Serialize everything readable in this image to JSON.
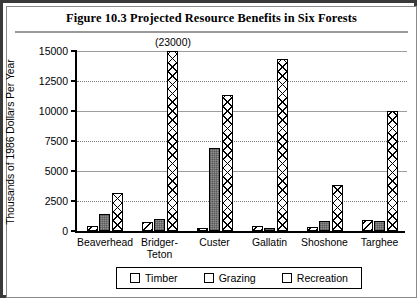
{
  "figure": {
    "title": "Figure 10.3   Projected Resource Benefits in Six Forests"
  },
  "chart_data": {
    "type": "bar",
    "title": "Figure 10.3   Projected Resource Benefits in Six Forests",
    "xlabel": "",
    "ylabel": "Thousands of 1986 Dollars Per Year",
    "ylim": [
      0,
      15000
    ],
    "yticks": [
      "0",
      "2500",
      "5000",
      "7500",
      "10000",
      "12500",
      "15000"
    ],
    "ytick_values": [
      0,
      2500,
      5000,
      7500,
      10000,
      12500,
      15000
    ],
    "grid": true,
    "legend_position": "bottom",
    "categories": [
      "Beaverhead",
      "Bridger-\nTeton",
      "Custer",
      "Gallatin",
      "Shoshone",
      "Targhee"
    ],
    "series": [
      {
        "name": "Timber",
        "pattern": "diagonal-hatch",
        "values": [
          400,
          750,
          200,
          450,
          300,
          900
        ]
      },
      {
        "name": "Grazing",
        "pattern": "solid-gray",
        "values": [
          1400,
          1000,
          6900,
          200,
          850,
          800
        ]
      },
      {
        "name": "Recreation",
        "pattern": "cross-hatch",
        "values": [
          3200,
          23000,
          11300,
          14300,
          3800,
          10000
        ]
      }
    ],
    "annotations": [
      {
        "text": "(23000)",
        "category": "Bridger-\nTeton",
        "series": "Recreation",
        "note": "bar clipped at axis top"
      }
    ]
  },
  "legend": {
    "items": [
      {
        "label": "Timber"
      },
      {
        "label": "Grazing"
      },
      {
        "label": "Recreation"
      }
    ]
  }
}
